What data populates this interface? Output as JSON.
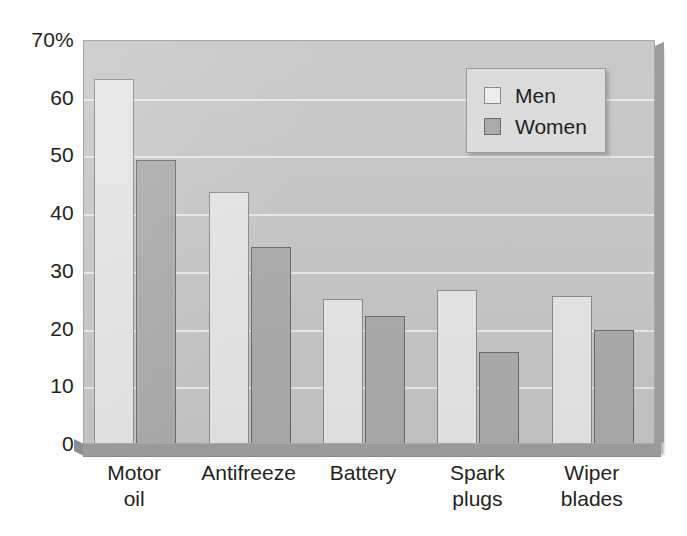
{
  "chart_data": {
    "type": "bar",
    "title": "",
    "xlabel": "",
    "ylabel": "",
    "categories": [
      "Motor oil",
      "Antifreeze",
      "Battery",
      "Spark plugs",
      "Wiper blades"
    ],
    "category_lines": [
      [
        "Motor",
        "oil"
      ],
      [
        "Antifreeze"
      ],
      [
        "Battery"
      ],
      [
        "Spark",
        "plugs"
      ],
      [
        "Wiper",
        "blades"
      ]
    ],
    "series": [
      {
        "name": "Men",
        "values": [
          63,
          43.5,
          25,
          26.5,
          25.5
        ],
        "color": "#e6e6e6"
      },
      {
        "name": "Women",
        "values": [
          49,
          34,
          22,
          15.7,
          19.5
        ],
        "color": "#ababab"
      }
    ],
    "ylim": [
      0,
      70
    ],
    "ytick_values": [
      70,
      60,
      50,
      40,
      30,
      20,
      10,
      0
    ],
    "ytick_labels": [
      "70%",
      "60",
      "50",
      "40",
      "30",
      "20",
      "10",
      "0"
    ],
    "grid": true,
    "legend_position": "top-right",
    "legend_entries": [
      "Men",
      "Women"
    ]
  },
  "colors": {
    "plot_background": "#c6c6c6",
    "page_background": "#ffffff",
    "gridline": "#efefef",
    "text": "#231f20",
    "men_bar": "#e6e6e6",
    "women_bar": "#ababab",
    "legend_background": "#dcdcdc"
  }
}
